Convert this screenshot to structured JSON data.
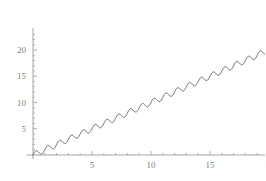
{
  "chart_data": {
    "type": "line",
    "title": "",
    "subtitle": "",
    "xlabel": "",
    "ylabel": "",
    "grid": false,
    "legend": null,
    "legend_position": "none",
    "xlim": [
      0,
      24
    ],
    "ylim": [
      0,
      23.6
    ],
    "xticks": [
      5,
      10,
      15,
      20
    ],
    "yticks": [
      5,
      10,
      15,
      20
    ],
    "xtick_labels": [
      "5",
      "10",
      "15",
      "20"
    ],
    "ytick_labels": [
      "5",
      "10",
      "15",
      "20"
    ],
    "minor_xtick_step": 1,
    "minor_ytick_step": 1,
    "series": [
      {
        "name": "x + sin(2 pi x)",
        "color": "#555555",
        "line_width": 0.9,
        "description": "linear ramp with superimposed sinusoidal oscillation",
        "trend_slope": 1.0,
        "trend_intercept": 0.0,
        "oscillation_amplitude": 0.55,
        "oscillation_period": 1.0,
        "oscillation_phase": 0.0,
        "n_cycles": 24,
        "x_start": 0,
        "x_end": 24,
        "y_start": 0,
        "y_end": 23.5,
        "samples_per_cycle": 36,
        "x": [
          0,
          2,
          4,
          6,
          8,
          10,
          12,
          14,
          16,
          18,
          20,
          22,
          24
        ],
        "y": [
          0,
          2,
          4,
          6,
          8,
          10,
          12,
          14,
          16,
          18,
          20,
          22,
          24
        ]
      }
    ],
    "axis_color": "#9a9a9a",
    "tick_color": "#9a9a9a",
    "background": "#ffffff",
    "axes_style": "mathematica-origin-axes"
  },
  "plot": {
    "name": "oscillating-linear-plot",
    "x_axis_name": "x-axis",
    "y_axis_name": "y-axis",
    "curve_name": "data-curve"
  }
}
